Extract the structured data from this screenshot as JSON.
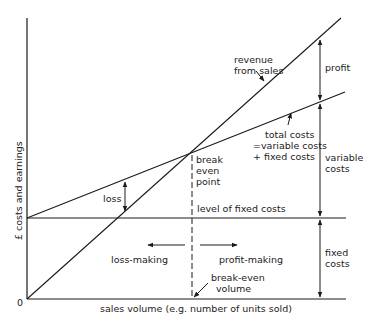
{
  "diagram": {
    "axes": {
      "y_label": "£ costs and earnings",
      "x_label": "sales volume (e.g. number of units sold)",
      "origin": "0"
    },
    "lines": {
      "revenue": [
        "revenue",
        "from sales"
      ],
      "total_costs": [
        "total costs",
        "=variable costs",
        "+ fixed costs"
      ],
      "fixed_costs_level": "level of fixed costs",
      "break_even_point": [
        "break",
        "even",
        "point"
      ],
      "break_even_volume": [
        "break-even",
        "volume"
      ]
    },
    "regions": {
      "loss": "loss",
      "profit": "profit",
      "variable_costs": [
        "variable",
        "costs"
      ],
      "fixed_costs": [
        "fixed",
        "costs"
      ],
      "loss_making": "loss-making",
      "profit_making": "profit-making"
    },
    "colors": {
      "ink": "#1a1a1a",
      "background": "#ffffff"
    }
  }
}
